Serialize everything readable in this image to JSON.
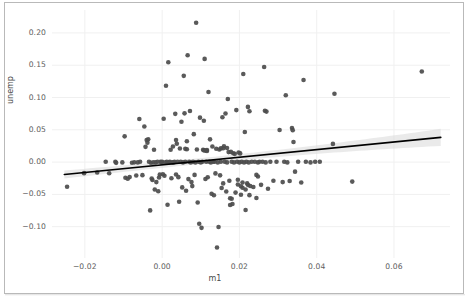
{
  "chart_data": {
    "type": "scatter",
    "title": "",
    "subtitle": "",
    "xlabel": "m1",
    "ylabel": "unemp",
    "xlim": [
      -0.0285,
      0.0745
    ],
    "ylim": [
      -0.1485,
      0.2355
    ],
    "xticks": [
      -0.02,
      0.0,
      0.02,
      0.04,
      0.06
    ],
    "xticklabels": [
      "−0.02",
      "0.00",
      "0.02",
      "0.04",
      "0.06"
    ],
    "yticks": [
      0.2,
      0.15,
      0.1,
      0.05,
      0.0,
      -0.05,
      -0.1
    ],
    "yticklabels": [
      "0.20",
      "0.15",
      "0.10",
      "0.05",
      "0.00",
      "−0.05",
      "−0.10"
    ],
    "grid": true,
    "legend": "none",
    "marker_color": "#4c4c4c",
    "marker_size": 4.6,
    "line_color": "#000000",
    "band_color": "#d9d9d9",
    "regression": {
      "x_start": -0.0253,
      "y_start": -0.0192,
      "x_end": 0.0721,
      "y_end": 0.0383,
      "band_halfwidth_start": 0.0098,
      "band_halfwidth_mid": 0.0046,
      "band_halfwidth_end": 0.0132,
      "band_center_x": 0.0095
    },
    "n_points": 203,
    "points": [
      [
        -0.0246,
        -0.0382
      ],
      [
        -0.0202,
        -0.0171
      ],
      [
        -0.0168,
        -0.0162
      ],
      [
        -0.0146,
        0.0005
      ],
      [
        -0.0137,
        -0.0172
      ],
      [
        -0.0121,
        0.0005
      ],
      [
        -0.0119,
        -0.0012
      ],
      [
        -0.0103,
        -0.0005
      ],
      [
        -0.0097,
        0.0399
      ],
      [
        -0.0095,
        -0.0242
      ],
      [
        -0.0089,
        -0.0258
      ],
      [
        -0.0084,
        -0.0232
      ],
      [
        -0.0078,
        -0.0009
      ],
      [
        -0.0072,
        -0.0004
      ],
      [
        -0.0067,
        -0.0208
      ],
      [
        -0.0063,
        -0.0005
      ],
      [
        -0.0059,
        0.0668
      ],
      [
        -0.0057,
        0.0005
      ],
      [
        -0.0051,
        -0.0202
      ],
      [
        -0.0046,
        0.0552
      ],
      [
        -0.0043,
        0.0236
      ],
      [
        -0.004,
        0.0343
      ],
      [
        -0.0038,
        0.0301
      ],
      [
        -0.0036,
        0.0352
      ],
      [
        -0.0034,
        0.0005
      ],
      [
        -0.0031,
        -0.0748
      ],
      [
        -0.0029,
        -0.001
      ],
      [
        -0.0027,
        -0.0255
      ],
      [
        -0.0025,
        -0.0277
      ],
      [
        -0.0023,
        -0.0005
      ],
      [
        -0.0021,
        0.0192
      ],
      [
        -0.0019,
        -0.0425
      ],
      [
        -0.0017,
        -0.0005
      ],
      [
        -0.0015,
        -0.031
      ],
      [
        -0.0012,
        0.0005
      ],
      [
        -0.001,
        -0.0452
      ],
      [
        -0.0008,
        -0.0238
      ],
      [
        -0.0006,
        -0.0192
      ],
      [
        -0.0004,
        0.0005
      ],
      [
        -0.0002,
        -0.0005
      ],
      [
        0.0,
        0.0005
      ],
      [
        0.0002,
        -0.0188
      ],
      [
        0.0004,
        0.0672
      ],
      [
        0.0006,
        -0.0211
      ],
      [
        0.0008,
        -0.0005
      ],
      [
        0.001,
        0.1182
      ],
      [
        0.0012,
        0.0005
      ],
      [
        0.0014,
        -0.066
      ],
      [
        0.0016,
        0.1545
      ],
      [
        0.0018,
        -0.0005
      ],
      [
        0.002,
        0.0005
      ],
      [
        0.0022,
        0.0192
      ],
      [
        0.0024,
        -0.0251
      ],
      [
        0.0026,
        -0.0005
      ],
      [
        0.0028,
        0.0242
      ],
      [
        0.003,
        -0.0005
      ],
      [
        0.0032,
        0.0005
      ],
      [
        0.0034,
        0.0747
      ],
      [
        0.0036,
        -0.0193
      ],
      [
        0.0038,
        0.0284
      ],
      [
        0.004,
        0.0005
      ],
      [
        0.0042,
        -0.0233
      ],
      [
        0.0044,
        -0.0613
      ],
      [
        0.0046,
        0.021
      ],
      [
        0.0048,
        0.0005
      ],
      [
        0.005,
        0.0625
      ],
      [
        0.0052,
        -0.0392
      ],
      [
        0.0054,
        -0.0005
      ],
      [
        0.0056,
        0.1335
      ],
      [
        0.0058,
        0.0755
      ],
      [
        0.006,
        0.0005
      ],
      [
        0.0062,
        -0.0444
      ],
      [
        0.0064,
        0.0322
      ],
      [
        0.0066,
        0.1655
      ],
      [
        0.0068,
        -0.0263
      ],
      [
        0.007,
        0.0005
      ],
      [
        0.0072,
        0.079
      ],
      [
        0.0074,
        -0.0005
      ],
      [
        0.0076,
        -0.031
      ],
      [
        0.0078,
        -0.0372
      ],
      [
        0.008,
        0.0005
      ],
      [
        0.0082,
        0.0433
      ],
      [
        0.0084,
        -0.0198
      ],
      [
        0.0086,
        -0.0005
      ],
      [
        0.0088,
        0.2158
      ],
      [
        0.009,
        0.0195
      ],
      [
        0.0092,
        -0.0625
      ],
      [
        0.0094,
        0.0005
      ],
      [
        0.0096,
        -0.0955
      ],
      [
        0.0098,
        0.0688
      ],
      [
        0.01,
        -0.0005
      ],
      [
        0.0102,
        -0.1018
      ],
      [
        0.0104,
        0.0005
      ],
      [
        0.0106,
        0.0192
      ],
      [
        0.0108,
        0.064
      ],
      [
        0.011,
        0.1598
      ],
      [
        0.0112,
        -0.0262
      ],
      [
        0.0114,
        0.0005
      ],
      [
        0.0116,
        0.0188
      ],
      [
        0.0118,
        -0.0235
      ],
      [
        0.012,
        0.1085
      ],
      [
        0.0122,
        0.0005
      ],
      [
        0.0124,
        0.0352
      ],
      [
        0.0126,
        -0.0005
      ],
      [
        0.0128,
        -0.0491
      ],
      [
        0.013,
        0.0242
      ],
      [
        0.0132,
        0.0005
      ],
      [
        0.0134,
        -0.0514
      ],
      [
        0.0136,
        0.0005
      ],
      [
        0.0138,
        -0.0175
      ],
      [
        0.014,
        0.0206
      ],
      [
        0.0142,
        -0.1322
      ],
      [
        0.0144,
        -0.0005
      ],
      [
        0.0146,
        -0.1005
      ],
      [
        0.0148,
        0.0195
      ],
      [
        0.015,
        -0.0205
      ],
      [
        0.0152,
        0.0005
      ],
      [
        0.0154,
        -0.0402
      ],
      [
        0.0156,
        0.0695
      ],
      [
        0.0158,
        -0.033
      ],
      [
        0.016,
        0.0245
      ],
      [
        0.0162,
        0.0005
      ],
      [
        0.0164,
        0.0752
      ],
      [
        0.0166,
        -0.0455
      ],
      [
        0.0168,
        -0.0005
      ],
      [
        0.017,
        0.0976
      ],
      [
        0.0172,
        0.0155
      ],
      [
        0.0174,
        -0.0288
      ],
      [
        0.0176,
        -0.0664
      ],
      [
        0.0178,
        0.0158
      ],
      [
        0.018,
        0.0005
      ],
      [
        0.0182,
        -0.065
      ],
      [
        0.0184,
        0.0138
      ],
      [
        0.0186,
        -0.0005
      ],
      [
        0.0188,
        0.0128
      ],
      [
        0.019,
        -0.0472
      ],
      [
        0.0192,
        0.0805
      ],
      [
        0.0194,
        0.0005
      ],
      [
        0.0196,
        -0.0273
      ],
      [
        0.0198,
        0.0148
      ],
      [
        0.02,
        -0.0005
      ],
      [
        0.0202,
        0.0135
      ],
      [
        0.0204,
        -0.0505
      ],
      [
        0.0206,
        0.0005
      ],
      [
        0.0208,
        -0.0315
      ],
      [
        0.021,
        0.1365
      ],
      [
        0.0212,
        -0.0005
      ],
      [
        0.0214,
        0.0465
      ],
      [
        0.0216,
        -0.0742
      ],
      [
        0.0218,
        0.0005
      ],
      [
        0.022,
        -0.033
      ],
      [
        0.0222,
        0.0855
      ],
      [
        0.0224,
        -0.0005
      ],
      [
        0.0226,
        0.0788
      ],
      [
        0.0228,
        -0.037
      ],
      [
        0.0232,
        0.0005
      ],
      [
        0.0236,
        -0.0385
      ],
      [
        0.024,
        0.0005
      ],
      [
        0.0244,
        -0.0555
      ],
      [
        0.0248,
        -0.0005
      ],
      [
        0.0252,
        0.0005
      ],
      [
        0.0256,
        -0.0352
      ],
      [
        0.026,
        0.0005
      ],
      [
        0.0264,
        0.1472
      ],
      [
        0.0266,
        0.0795
      ],
      [
        0.0268,
        -0.0005
      ],
      [
        0.027,
        0.0782
      ],
      [
        0.0274,
        -0.0412
      ],
      [
        0.028,
        0.0005
      ],
      [
        0.0288,
        -0.0288
      ],
      [
        0.0296,
        0.0005
      ],
      [
        0.0304,
        0.0498
      ],
      [
        0.0312,
        -0.031
      ],
      [
        0.0316,
        0.0005
      ],
      [
        0.032,
        0.1035
      ],
      [
        0.0324,
        -0.0005
      ],
      [
        0.033,
        -0.0292
      ],
      [
        0.0336,
        0.0528
      ],
      [
        0.0338,
        0.0495
      ],
      [
        0.034,
        0.031
      ],
      [
        0.0344,
        -0.0148
      ],
      [
        0.0352,
        0.0005
      ],
      [
        0.036,
        -0.0315
      ],
      [
        0.0366,
        0.1272
      ],
      [
        0.0372,
        0.0005
      ],
      [
        0.0384,
        -0.0005
      ],
      [
        0.0396,
        0.0005
      ],
      [
        0.0408,
        0.0005
      ],
      [
        0.0442,
        0.0282
      ],
      [
        0.0446,
        0.1058
      ],
      [
        0.0492,
        -0.0302
      ],
      [
        0.0672,
        0.1402
      ],
      [
        0.0036,
        0.0342
      ],
      [
        0.0108,
        0.0182
      ],
      [
        0.0112,
        0.0178
      ],
      [
        0.0116,
        0.0172
      ],
      [
        0.006,
        0.0205
      ],
      [
        0.0064,
        0.02
      ],
      [
        0.0152,
        0.0212
      ],
      [
        0.0158,
        0.0215
      ],
      [
        0.0168,
        0.0218
      ],
      [
        0.0176,
        -0.056
      ],
      [
        0.018,
        -0.0568
      ],
      [
        0.0196,
        -0.0348
      ],
      [
        0.0204,
        -0.0375
      ],
      [
        0.0208,
        -0.0398
      ],
      [
        0.0216,
        -0.0425
      ],
      [
        0.0222,
        -0.0352
      ],
      [
        0.0226,
        -0.0512
      ],
      [
        0.0244,
        -0.0198
      ],
      [
        0.0248,
        -0.0222
      ]
    ]
  },
  "figure": {
    "border_color": "#b9b9b9",
    "background": "#ffffff"
  }
}
